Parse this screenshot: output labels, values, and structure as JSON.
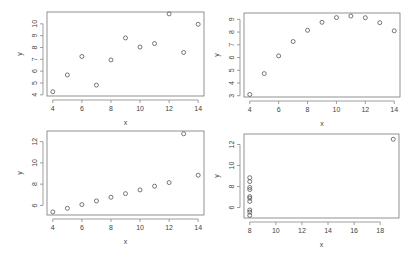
{
  "chart_data": [
    {
      "type": "scatter",
      "title": "",
      "xlabel": "x",
      "ylabel": "y",
      "xlim": [
        3.6,
        14.4
      ],
      "ylim": [
        3.9,
        11.0
      ],
      "xticks": [
        4,
        6,
        8,
        10,
        12,
        14
      ],
      "yticks": [
        4,
        5,
        6,
        7,
        8,
        9,
        10
      ],
      "grid": false,
      "x": [
        10,
        8,
        13,
        9,
        11,
        14,
        6,
        4,
        12,
        7,
        5
      ],
      "y": [
        8.04,
        6.95,
        7.58,
        8.81,
        8.33,
        9.96,
        7.24,
        4.26,
        10.84,
        4.82,
        5.68
      ]
    },
    {
      "type": "scatter",
      "title": "",
      "xlabel": "x",
      "ylabel": "y",
      "xlim": [
        3.6,
        14.4
      ],
      "ylim": [
        2.9,
        9.5
      ],
      "xticks": [
        4,
        6,
        8,
        10,
        12,
        14
      ],
      "yticks": [
        3,
        4,
        5,
        6,
        7,
        8,
        9
      ],
      "grid": false,
      "x": [
        10,
        8,
        13,
        9,
        11,
        14,
        6,
        4,
        12,
        7,
        5
      ],
      "y": [
        9.14,
        8.14,
        8.74,
        8.77,
        9.26,
        8.1,
        6.13,
        3.1,
        9.13,
        7.26,
        4.74
      ]
    },
    {
      "type": "scatter",
      "title": "",
      "xlabel": "x",
      "ylabel": "y",
      "xlim": [
        3.6,
        14.4
      ],
      "ylim": [
        5.1,
        13.0
      ],
      "xticks": [
        4,
        6,
        8,
        10,
        12,
        14
      ],
      "yticks": [
        6,
        8,
        10,
        12
      ],
      "grid": false,
      "x": [
        10,
        8,
        13,
        9,
        11,
        14,
        6,
        4,
        12,
        7,
        5
      ],
      "y": [
        7.46,
        6.77,
        12.74,
        7.11,
        7.81,
        8.84,
        6.08,
        5.39,
        8.15,
        6.42,
        5.73
      ]
    },
    {
      "type": "scatter",
      "title": "",
      "xlabel": "x",
      "ylabel": "y",
      "xlim": [
        7.56,
        19.44
      ],
      "ylim": [
        5.0,
        13.0
      ],
      "xticks": [
        8,
        10,
        12,
        14,
        16,
        18
      ],
      "yticks": [
        6,
        8,
        10,
        12
      ],
      "grid": false,
      "x": [
        8,
        8,
        8,
        8,
        8,
        8,
        8,
        19,
        8,
        8,
        8
      ],
      "y": [
        6.58,
        5.76,
        7.71,
        8.84,
        8.47,
        7.04,
        5.25,
        12.5,
        5.56,
        7.91,
        6.89
      ]
    }
  ],
  "panels_layout": [
    {
      "box": [
        47,
        12,
        204,
        96
      ]
    },
    {
      "box": [
        244,
        13,
        400,
        97
      ]
    },
    {
      "box": [
        47,
        131,
        204,
        215
      ]
    },
    {
      "box": [
        244,
        134,
        399,
        218
      ]
    }
  ]
}
